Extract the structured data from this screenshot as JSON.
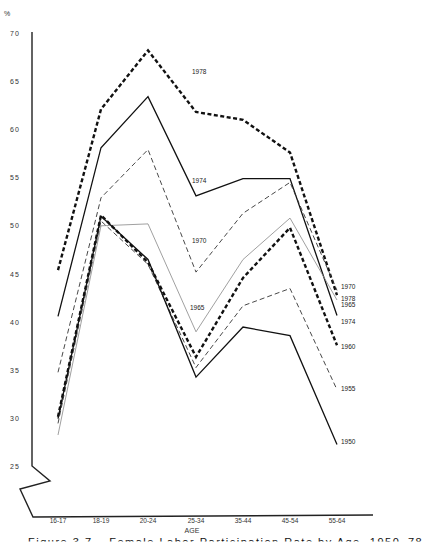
{
  "chart_data": {
    "type": "line",
    "title": "",
    "caption": "Figure 3.7 – Female Labor Participation Rate by Age, 1950–78",
    "xlabel": "AGE",
    "ylabel": "%",
    "ylim": [
      25,
      70
    ],
    "yticks": [
      25,
      30,
      35,
      40,
      45,
      50,
      55,
      60,
      65,
      70
    ],
    "ytick_labels": [
      "25",
      "30",
      "35",
      "40",
      "45",
      "50",
      "55",
      "60",
      "65",
      "70"
    ],
    "grid": false,
    "legend_position": "inline labels at line ends",
    "categories": [
      "16-17",
      "18-19",
      "20-24",
      "25-34",
      "35-44",
      "45-54",
      "55-64"
    ],
    "series": [
      {
        "name": "1978",
        "style": "heavy-dash",
        "values": [
          45.4,
          62.1,
          68.2,
          61.8,
          61.0,
          57.6,
          42.8
        ],
        "label_pos": "inline-25-34"
      },
      {
        "name": "1974",
        "style": "solid",
        "values": [
          40.6,
          58.1,
          63.4,
          53.1,
          54.9,
          54.9,
          40.7
        ],
        "label_pos": "inline-25-34"
      },
      {
        "name": "1970",
        "style": "light-dash",
        "values": [
          34.8,
          52.9,
          57.9,
          45.2,
          51.3,
          54.5,
          43.3
        ],
        "label_pos": "inline-25-34"
      },
      {
        "name": "1965",
        "style": "thin-gray",
        "values": [
          28.3,
          50.0,
          50.2,
          39.0,
          46.5,
          50.8,
          42.3
        ],
        "label_pos": "inline-25-34"
      },
      {
        "name": "1960",
        "style": "heavy-dash",
        "values": [
          30.2,
          51.1,
          46.2,
          36.4,
          44.6,
          49.8,
          37.6
        ],
        "label_pos": "end"
      },
      {
        "name": "1955",
        "style": "light-dash",
        "values": [
          29.5,
          50.5,
          46.0,
          35.3,
          41.7,
          43.5,
          33.0
        ],
        "label_pos": "end"
      },
      {
        "name": "1950",
        "style": "solid",
        "values": [
          30.0,
          51.0,
          46.5,
          34.3,
          39.5,
          38.6,
          27.3
        ],
        "label_pos": "end"
      }
    ],
    "end_labels": [
      "1970",
      "1978",
      "1965",
      "1974",
      "1960",
      "1955",
      "1950"
    ],
    "inline_labels": [
      "1978",
      "1974",
      "1970",
      "1965"
    ]
  }
}
